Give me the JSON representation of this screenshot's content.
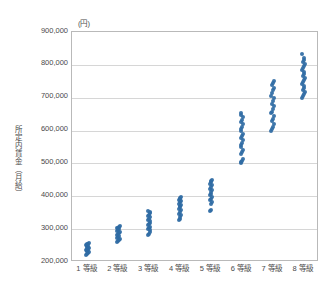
{
  "chart": {
    "type": "scatter",
    "title": "",
    "unit_caption": "(円)",
    "ylabel": "所定内賃金（月給）",
    "xlabel": ""
  },
  "chart_data": {
    "type": "scatter",
    "title": "",
    "xlabel": "",
    "ylabel": "所定内賃金（月給）",
    "unit": "(円)",
    "grid": true,
    "legend": "none",
    "ylim": [
      200000,
      900000
    ],
    "yticks": [
      200000,
      300000,
      400000,
      500000,
      600000,
      700000,
      800000,
      900000
    ],
    "ytick_labels": [
      "200,000",
      "300,000",
      "400,000",
      "500,000",
      "600,000",
      "700,000",
      "800,000",
      "900,000"
    ],
    "categories": [
      "1 等級",
      "2 等級",
      "3 等級",
      "4 等級",
      "5 等級",
      "6 等級",
      "7 等級",
      "8 等級"
    ],
    "series": [
      {
        "name": "所定内賃金",
        "color": "#2f6ba4",
        "points": [
          {
            "category": "1 等級",
            "values": [
              221000,
              224000,
              227000,
              230000,
              232000,
              234000,
              236000,
              238000,
              240000,
              242000,
              244000,
              246000,
              248000,
              250000,
              252000,
              254000,
              256000,
              258000
            ]
          },
          {
            "category": "2 等級",
            "values": [
              261000,
              264000,
              267000,
              270000,
              273000,
              276000,
              279000,
              282000,
              285000,
              288000,
              291000,
              294000,
              297000,
              300000,
              303000,
              305000,
              307000,
              309000
            ]
          },
          {
            "category": "3 等級",
            "values": [
              281000,
              286000,
              291000,
              296000,
              300000,
              304000,
              308000,
              312000,
              316000,
              320000,
              324000,
              328000,
              332000,
              336000,
              340000,
              344000,
              348000,
              352000,
              355000
            ]
          },
          {
            "category": "4 等級",
            "values": [
              327000,
              332000,
              337000,
              342000,
              347000,
              352000,
              357000,
              362000,
              366000,
              370000,
              374000,
              378000,
              382000,
              386000,
              390000,
              393000,
              396000,
              398000
            ]
          },
          {
            "category": "5 等級",
            "values": [
              355000,
              359000,
              378000,
              383000,
              388000,
              393000,
              398000,
              403000,
              408000,
              413000,
              418000,
              423000,
              428000,
              433000,
              438000,
              443000,
              447000,
              450000
            ]
          },
          {
            "category": "6 等級",
            "values": [
              500000,
              504000,
              508000,
              512000,
              528000,
              535000,
              542000,
              549000,
              556000,
              563000,
              570000,
              577000,
              584000,
              591000,
              598000,
              605000,
              612000,
              619000,
              626000,
              633000,
              640000,
              647000,
              653000
            ]
          },
          {
            "category": "7 等級",
            "values": [
              600000,
              606000,
              612000,
              620000,
              628000,
              636000,
              645000,
              653000,
              658000,
              666000,
              674000,
              682000,
              690000,
              698000,
              706000,
              714000,
              722000,
              730000,
              738000,
              745000,
              750000
            ]
          },
          {
            "category": "8 等級",
            "values": [
              700000,
              706000,
              712000,
              718000,
              724000,
              730000,
              736000,
              742000,
              748000,
              754000,
              760000,
              766000,
              772000,
              778000,
              784000,
              790000,
              796000,
              802000,
              808000,
              814000,
              820000,
              834000
            ]
          }
        ]
      }
    ]
  }
}
